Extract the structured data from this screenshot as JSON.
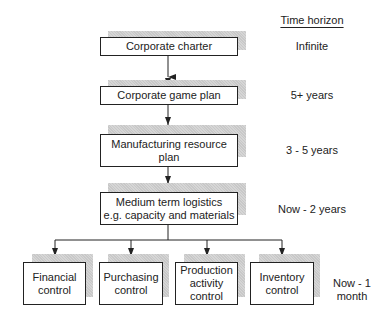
{
  "header": {
    "time_horizon_title": "Time horizon"
  },
  "levels": [
    {
      "box": "Corporate charter",
      "horizon": "Infinite"
    },
    {
      "box": "Corporate game plan",
      "horizon": "5+ years"
    },
    {
      "box": "Manufacturing resource plan",
      "horizon": "3 - 5 years"
    },
    {
      "box_line1": "Medium term logistics",
      "box_line2": "e.g. capacity and materials",
      "horizon": "Now - 2 years"
    }
  ],
  "bottom": {
    "boxes": [
      {
        "line1": "Financial",
        "line2": "control"
      },
      {
        "line1": "Purchasing",
        "line2": "control"
      },
      {
        "line1": "Production",
        "line2": "activity",
        "line3": "control"
      },
      {
        "line1": "Inventory",
        "line2": "control"
      }
    ],
    "horizon_line1": "Now - 1",
    "horizon_line2": "month"
  }
}
